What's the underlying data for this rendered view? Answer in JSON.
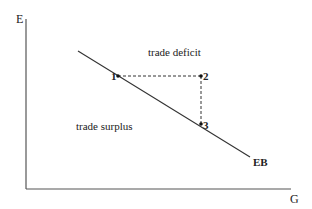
{
  "diagram": {
    "axes": {
      "y_label": "E",
      "x_label": "G"
    },
    "curve_label": "EB",
    "regions": {
      "above": "trade deficit",
      "below": "trade surplus"
    },
    "points": [
      {
        "label": "1"
      },
      {
        "label": "2"
      },
      {
        "label": "3"
      }
    ],
    "colors": {
      "line": "#333333",
      "text": "#222222"
    }
  }
}
